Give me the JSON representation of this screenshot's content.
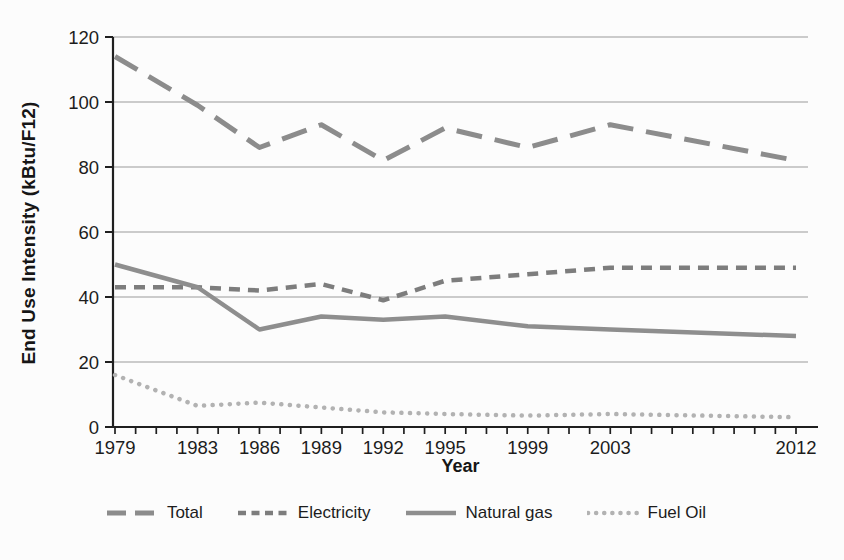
{
  "figure": {
    "background": "#fcfcfc",
    "axis_color": "#1f1f1f",
    "grid_color": "#9a9a9a",
    "text_color": "#1c1c1c"
  },
  "chart_data": {
    "type": "line",
    "title": "",
    "xlabel": "Year",
    "ylabel": "End Use Intensity (kBtu/F12)",
    "x": [
      1979,
      1983,
      1986,
      1989,
      1992,
      1995,
      1999,
      2003,
      2012
    ],
    "xlim": [
      1979,
      2012
    ],
    "ylim": [
      0,
      120
    ],
    "yticks": [
      0,
      20,
      40,
      60,
      80,
      100,
      120
    ],
    "xtick_labels": [
      "1979",
      "1983",
      "1986",
      "1989",
      "1992",
      "1995",
      "1999",
      "2003",
      "2012"
    ],
    "minor_xticks": "every year from 1979 to 2012",
    "grid": "horizontal gridlines at each ytick",
    "legend_position": "bottom center",
    "series": [
      {
        "name": "Total",
        "style": "long-dash",
        "color": "#8c8c8c",
        "values": [
          114,
          99,
          86,
          93,
          82,
          92,
          86,
          93,
          82
        ]
      },
      {
        "name": "Electricity",
        "style": "short-dash",
        "color": "#7d7d7d",
        "values": [
          43,
          43,
          42,
          44,
          39,
          45,
          47,
          49,
          49
        ]
      },
      {
        "name": "Natural gas",
        "style": "solid",
        "color": "#8e8e8e",
        "values": [
          50,
          43,
          30,
          34,
          33,
          34,
          31,
          30,
          28
        ]
      },
      {
        "name": "Fuel Oil",
        "style": "dotted",
        "color": "#b2b2b2",
        "values": [
          16,
          6.5,
          7.5,
          6,
          4.5,
          4,
          3.5,
          4,
          3
        ]
      }
    ]
  }
}
